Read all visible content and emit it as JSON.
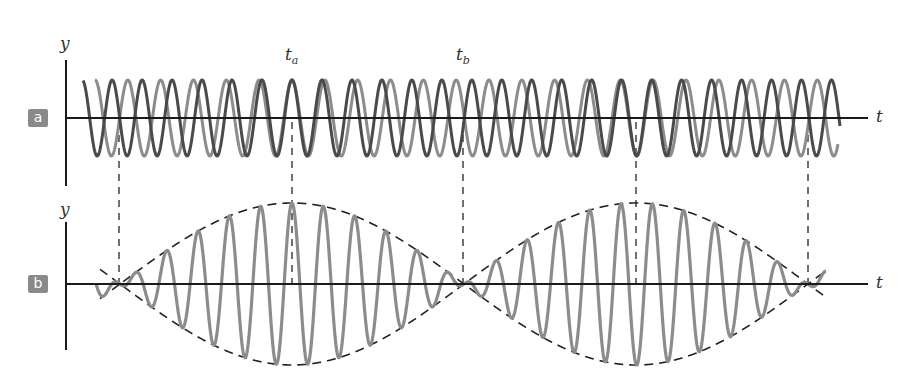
{
  "panels": {
    "a": {
      "label": "a",
      "y_label": "y",
      "t_label": "t",
      "marker_a": "t",
      "marker_a_sub": "a",
      "marker_b": "t",
      "marker_b_sub": "b"
    },
    "b": {
      "label": "b",
      "y_label": "y",
      "t_label": "t"
    }
  },
  "colors": {
    "label_bg": "#8a8a8a",
    "wave_dark": "#4a4a4a",
    "wave_light": "#8c8c8c",
    "sum_wave": "#8c8c8c",
    "axis": "#1a1a1a",
    "dashed": "#333333"
  },
  "chart_data": {
    "type": "line",
    "panels": [
      {
        "id": "a",
        "description": "Two individual sinusoidal waves y1(t), y2(t) with slightly different frequencies plotted against t",
        "xlabel": "t",
        "ylabel": "y",
        "series": [
          {
            "name": "wave 1 (dark)",
            "amplitude": 1,
            "period_px": 30.0
          },
          {
            "name": "wave 2 (light)",
            "amplitude": 1,
            "period_px": 32.8
          }
        ],
        "annotations": [
          {
            "text": "t_a",
            "meaning": "waves in phase (constructive)",
            "x_px": 292
          },
          {
            "text": "t_b",
            "meaning": "waves out of phase (destructive)",
            "x_px": 463
          }
        ]
      },
      {
        "id": "b",
        "description": "Resultant y = y1 + y2 showing beat envelope (dashed)",
        "xlabel": "t",
        "ylabel": "y",
        "series": [
          {
            "name": "resultant",
            "amplitude_max": 2,
            "envelope": "dashed |2A cos(pi*df*t)|"
          }
        ],
        "nodes_x_px": [
          119,
          463,
          808
        ],
        "antinodes_x_px": [
          292,
          636
        ],
        "beat_period_px": 344
      }
    ],
    "dashed_verticals_x_px": [
      119,
      292,
      463,
      636,
      808
    ]
  }
}
